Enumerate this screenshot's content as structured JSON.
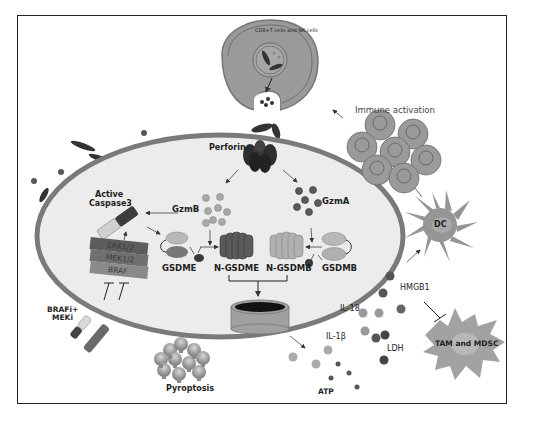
{
  "figure": {
    "colors": {
      "frame": "#222222",
      "cell_membrane": "#7a7a7a",
      "cytoplasm": "#ececec",
      "killer_cell": "#9a9a9a",
      "dark_protein": "#444444",
      "mid_protein": "#8c8c8c",
      "light_protein": "#b5b5b5"
    }
  },
  "labels": {
    "killer_cell": "CD8+T cells and NK cells",
    "perforin": "Perforin",
    "immune_activation": "Immune activation",
    "active_caspase3": "Active",
    "active_caspase3_line2": "Caspase3",
    "gzmb": "GzmB",
    "gzma": "GzmA",
    "erk": "ERK1/2",
    "mek": "MEK1/2",
    "braf": "BRAF",
    "gsdme": "GSDME",
    "n_gsdme": "N-GSDME",
    "n_gsdmb": "N-GSDMB",
    "gsdmb": "GSDMB",
    "brafi_meki_line1": "BRAFi+",
    "brafi_meki_line2": "MEKi",
    "dc": "DC",
    "hmgb1": "HMGB1",
    "il18": "IL-18",
    "il1b": "IL-1β",
    "ldh": "LDH",
    "atp": "ATP",
    "tam_mdsc": "TAM and MDSC",
    "pyroptosis": "Pyroptosis"
  }
}
